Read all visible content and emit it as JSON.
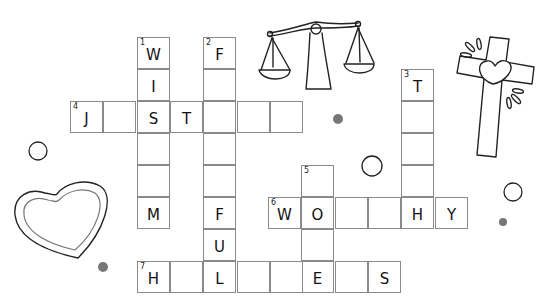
{
  "puzzle": {
    "type": "crossword",
    "cell_size": [
      33,
      32
    ],
    "clue_numbers": [
      {
        "number": "1",
        "direction": "down",
        "answer_shown": "W I S _ _ M",
        "length": 6
      },
      {
        "number": "2",
        "direction": "down",
        "answer_shown": "F _ _ _ _ F U L",
        "length": 8
      },
      {
        "number": "3",
        "direction": "down",
        "answer_shown": "T _ _ _ H",
        "length": 5
      },
      {
        "number": "4",
        "direction": "across",
        "answer_shown": "J _ S T _ _ _",
        "length": 7
      },
      {
        "number": "5",
        "direction": "down",
        "answer_shown": "_ O _ E",
        "length": 4
      },
      {
        "number": "6",
        "direction": "across",
        "answer_shown": "W O _ _ H Y",
        "length": 6
      },
      {
        "number": "7",
        "direction": "across",
        "answer_shown": "H _ L _ _ E _ S",
        "length": 8
      }
    ],
    "cells": [
      {
        "x": 137,
        "y": 37,
        "num": "1",
        "letter": "W"
      },
      {
        "x": 137,
        "y": 69,
        "num": "",
        "letter": "I"
      },
      {
        "x": 137,
        "y": 101,
        "num": "",
        "letter": "S"
      },
      {
        "x": 137,
        "y": 133,
        "num": "",
        "letter": ""
      },
      {
        "x": 137,
        "y": 165,
        "num": "",
        "letter": ""
      },
      {
        "x": 137,
        "y": 197,
        "num": "",
        "letter": "M"
      },
      {
        "x": 203,
        "y": 37,
        "num": "2",
        "letter": "F"
      },
      {
        "x": 203,
        "y": 69,
        "num": "",
        "letter": ""
      },
      {
        "x": 203,
        "y": 101,
        "num": "",
        "letter": ""
      },
      {
        "x": 203,
        "y": 133,
        "num": "",
        "letter": ""
      },
      {
        "x": 203,
        "y": 165,
        "num": "",
        "letter": ""
      },
      {
        "x": 203,
        "y": 197,
        "num": "",
        "letter": "F"
      },
      {
        "x": 203,
        "y": 229,
        "num": "",
        "letter": "U"
      },
      {
        "x": 203,
        "y": 261,
        "num": "",
        "letter": "L"
      },
      {
        "x": 401,
        "y": 69,
        "num": "3",
        "letter": "T"
      },
      {
        "x": 401,
        "y": 101,
        "num": "",
        "letter": ""
      },
      {
        "x": 401,
        "y": 133,
        "num": "",
        "letter": ""
      },
      {
        "x": 401,
        "y": 165,
        "num": "",
        "letter": ""
      },
      {
        "x": 401,
        "y": 197,
        "num": "",
        "letter": "H"
      },
      {
        "x": 70,
        "y": 101,
        "num": "4",
        "letter": "J"
      },
      {
        "x": 103,
        "y": 101,
        "num": "",
        "letter": ""
      },
      {
        "x": 170,
        "y": 101,
        "num": "",
        "letter": "T"
      },
      {
        "x": 237,
        "y": 101,
        "num": "",
        "letter": ""
      },
      {
        "x": 270,
        "y": 101,
        "num": "",
        "letter": ""
      },
      {
        "x": 301,
        "y": 165,
        "num": "5",
        "letter": ""
      },
      {
        "x": 301,
        "y": 197,
        "num": "",
        "letter": "O"
      },
      {
        "x": 301,
        "y": 229,
        "num": "",
        "letter": ""
      },
      {
        "x": 301,
        "y": 261,
        "num": "",
        "letter": "E"
      },
      {
        "x": 268,
        "y": 197,
        "num": "6",
        "letter": "W"
      },
      {
        "x": 335,
        "y": 197,
        "num": "",
        "letter": ""
      },
      {
        "x": 368,
        "y": 197,
        "num": "",
        "letter": ""
      },
      {
        "x": 435,
        "y": 197,
        "num": "",
        "letter": "Y"
      },
      {
        "x": 137,
        "y": 261,
        "num": "7",
        "letter": "H"
      },
      {
        "x": 170,
        "y": 261,
        "num": "",
        "letter": ""
      },
      {
        "x": 237,
        "y": 261,
        "num": "",
        "letter": ""
      },
      {
        "x": 270,
        "y": 261,
        "num": "",
        "letter": ""
      },
      {
        "x": 335,
        "y": 261,
        "num": "",
        "letter": ""
      },
      {
        "x": 368,
        "y": 261,
        "num": "",
        "letter": "S"
      }
    ]
  },
  "decorations": {
    "icons": [
      "scales-of-justice-icon",
      "cross-with-heart-icon",
      "heart-outline-icon"
    ],
    "circles": [
      {
        "cx": 38,
        "cy": 151,
        "r": 9
      },
      {
        "cx": 372,
        "cy": 166,
        "r": 10
      },
      {
        "cx": 513,
        "cy": 192,
        "r": 9
      }
    ],
    "dots": [
      {
        "cx": 338,
        "cy": 119,
        "r": 5
      },
      {
        "cx": 503,
        "cy": 222,
        "r": 4
      },
      {
        "cx": 103,
        "cy": 267,
        "r": 5
      }
    ],
    "colors": {
      "grid_border": "#8a8a8a",
      "dot": "#777777",
      "outline": "#222222"
    }
  }
}
